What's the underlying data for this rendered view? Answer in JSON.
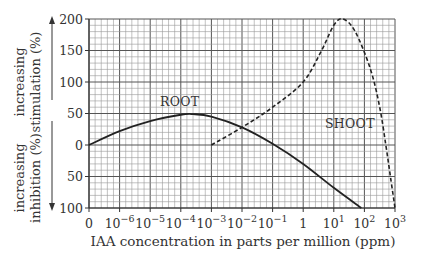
{
  "chart_data": {
    "type": "line",
    "title": "",
    "xlabel": "IAA concentration in parts per million (ppm)",
    "ylabel_upper": [
      "increasing",
      "stimulation (%)"
    ],
    "ylabel_lower": [
      "increasing",
      "inhibition (%)"
    ],
    "x_tick_labels": [
      "0",
      "10^-6",
      "10^-5",
      "10^-4",
      "10^-3",
      "10^-2",
      "10^-1",
      "1",
      "10^1",
      "10^2",
      "10^3"
    ],
    "x_scale": "logarithmic (decade positions 0..10; position 0 labelled '0')",
    "y_tick_labels_stimulation": [
      "200",
      "150",
      "100",
      "50",
      "0"
    ],
    "y_tick_labels_inhibition": [
      "50",
      "100"
    ],
    "ylim": [
      -100,
      200
    ],
    "grid": true,
    "legend": "none (curves labelled directly)",
    "series": [
      {
        "name": "ROOT",
        "style": "solid",
        "points_position_value": [
          [
            0,
            0
          ],
          [
            1,
            22
          ],
          [
            2,
            38
          ],
          [
            3,
            48
          ],
          [
            3.4,
            49
          ],
          [
            4,
            45
          ],
          [
            5,
            28
          ],
          [
            6,
            2
          ],
          [
            7,
            -30
          ],
          [
            8,
            -68
          ],
          [
            8.9,
            -100
          ]
        ]
      },
      {
        "name": "SHOOT",
        "style": "dashed",
        "points_position_value": [
          [
            4,
            0
          ],
          [
            5,
            28
          ],
          [
            6,
            60
          ],
          [
            7,
            100
          ],
          [
            7.6,
            150
          ],
          [
            8,
            190
          ],
          [
            8.3,
            200
          ],
          [
            8.7,
            180
          ],
          [
            9.2,
            120
          ],
          [
            9.5,
            60
          ],
          [
            9.7,
            0
          ],
          [
            9.85,
            -50
          ],
          [
            10,
            -100
          ]
        ]
      }
    ],
    "annotations": [
      "ROOT",
      "SHOOT"
    ]
  }
}
